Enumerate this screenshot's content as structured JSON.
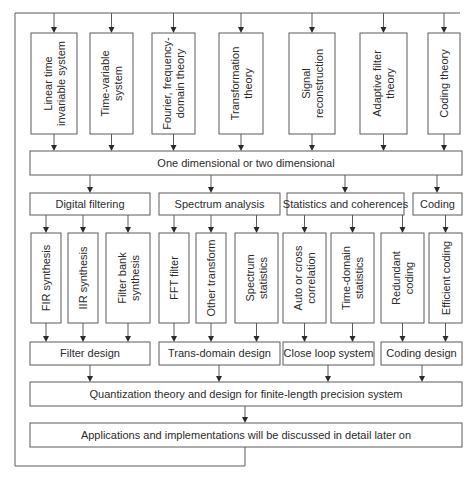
{
  "top_theories": [
    {
      "id": "linear",
      "lines": [
        "Linear time",
        "invariable system"
      ]
    },
    {
      "id": "timevar",
      "lines": [
        "Time-variable",
        "system"
      ]
    },
    {
      "id": "fourier",
      "lines": [
        "Fourier, frequency-",
        "domain theory"
      ]
    },
    {
      "id": "transform",
      "lines": [
        "Transformation",
        "theory"
      ]
    },
    {
      "id": "signal",
      "lines": [
        "Signal",
        "reconstruction"
      ]
    },
    {
      "id": "adaptive",
      "lines": [
        "Adaptive filter",
        "theory"
      ]
    },
    {
      "id": "coding",
      "lines": [
        "Coding theory"
      ]
    }
  ],
  "dimension_box": "One dimensional or two dimensional",
  "categories": [
    {
      "label": "Digital filtering"
    },
    {
      "label": "Spectrum analysis"
    },
    {
      "label": "Statistics and coherences"
    },
    {
      "label": "Coding"
    }
  ],
  "methods": [
    {
      "lines": [
        "FIR synthesis"
      ]
    },
    {
      "lines": [
        "IIR synthesis"
      ]
    },
    {
      "lines": [
        "Filter bank",
        "synthesis"
      ]
    },
    {
      "lines": [
        "FFT filter"
      ]
    },
    {
      "lines": [
        "Other transform"
      ]
    },
    {
      "lines": [
        "Spectrum",
        "statistics"
      ]
    },
    {
      "lines": [
        "Auto or cross",
        "correlation"
      ]
    },
    {
      "lines": [
        "Time-domain",
        "statistics"
      ]
    },
    {
      "lines": [
        "Redundant",
        "coding"
      ]
    },
    {
      "lines": [
        "Efficient coding"
      ]
    }
  ],
  "designs": [
    {
      "label": "Filter design"
    },
    {
      "label": "Trans-domain design"
    },
    {
      "label": "Close loop system"
    },
    {
      "label": "Coding design"
    }
  ],
  "quantization_box": "Quantization theory and design for finite-length precision system",
  "applications_box": "Applications and implementations will be discussed in detail later on",
  "colors": {
    "stroke": "#5a5a5a",
    "text": "#2b2b2b",
    "background": "#ffffff"
  }
}
